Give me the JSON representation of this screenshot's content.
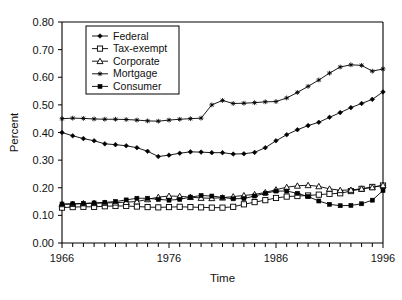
{
  "chart_data": {
    "type": "line",
    "title": "",
    "xlabel": "Time",
    "ylabel": "Percent",
    "xlim": [
      1966,
      1996
    ],
    "ylim": [
      0.0,
      0.8
    ],
    "ytick_labels": [
      "0.00",
      "0.10",
      "0.20",
      "0.30",
      "0.40",
      "0.50",
      "0.60",
      "0.70",
      "0.80"
    ],
    "ytick_values": [
      0.0,
      0.1,
      0.2,
      0.3,
      0.4,
      0.5,
      0.6,
      0.7,
      0.8
    ],
    "xtick_labels": [
      "1966",
      "1976",
      "1986",
      "1996"
    ],
    "xtick_values": [
      1966,
      1976,
      1986,
      1996
    ],
    "x_minor_tick_step": 1,
    "grid": false,
    "legend_position": "top-left-inside",
    "x": [
      1966,
      1967,
      1968,
      1969,
      1970,
      1971,
      1972,
      1973,
      1974,
      1975,
      1976,
      1977,
      1978,
      1979,
      1980,
      1981,
      1982,
      1983,
      1984,
      1985,
      1986,
      1987,
      1988,
      1989,
      1990,
      1991,
      1992,
      1993,
      1994,
      1995,
      1996
    ],
    "series": [
      {
        "name": "Federal",
        "marker": "filled-diamond",
        "values": [
          0.4,
          0.388,
          0.378,
          0.37,
          0.359,
          0.356,
          0.352,
          0.345,
          0.332,
          0.313,
          0.318,
          0.325,
          0.33,
          0.329,
          0.327,
          0.327,
          0.322,
          0.323,
          0.328,
          0.345,
          0.37,
          0.392,
          0.41,
          0.425,
          0.437,
          0.455,
          0.472,
          0.49,
          0.505,
          0.52,
          0.547
        ]
      },
      {
        "name": "Tax-exempt",
        "marker": "open-square",
        "values": [
          0.128,
          0.13,
          0.131,
          0.131,
          0.133,
          0.134,
          0.134,
          0.132,
          0.13,
          0.129,
          0.13,
          0.131,
          0.13,
          0.129,
          0.128,
          0.128,
          0.131,
          0.14,
          0.148,
          0.155,
          0.163,
          0.168,
          0.17,
          0.172,
          0.175,
          0.178,
          0.18,
          0.188,
          0.196,
          0.203,
          0.208
        ]
      },
      {
        "name": "Corporate",
        "marker": "open-triangle",
        "values": [
          0.14,
          0.141,
          0.143,
          0.144,
          0.145,
          0.146,
          0.148,
          0.15,
          0.158,
          0.166,
          0.17,
          0.169,
          0.166,
          0.163,
          0.162,
          0.164,
          0.168,
          0.172,
          0.176,
          0.183,
          0.193,
          0.202,
          0.207,
          0.209,
          0.205,
          0.196,
          0.191,
          0.192,
          0.196,
          0.201,
          0.209
        ]
      },
      {
        "name": "Mortgage",
        "marker": "asterisk",
        "values": [
          0.45,
          0.452,
          0.451,
          0.449,
          0.448,
          0.448,
          0.447,
          0.445,
          0.442,
          0.441,
          0.445,
          0.448,
          0.45,
          0.452,
          0.5,
          0.516,
          0.505,
          0.506,
          0.508,
          0.511,
          0.512,
          0.525,
          0.545,
          0.567,
          0.59,
          0.615,
          0.637,
          0.645,
          0.643,
          0.622,
          0.63
        ]
      },
      {
        "name": "Consumer",
        "marker": "filled-square",
        "values": [
          0.141,
          0.142,
          0.143,
          0.145,
          0.147,
          0.15,
          0.156,
          0.162,
          0.162,
          0.158,
          0.155,
          0.158,
          0.166,
          0.172,
          0.17,
          0.165,
          0.16,
          0.161,
          0.17,
          0.18,
          0.188,
          0.188,
          0.18,
          0.168,
          0.152,
          0.14,
          0.135,
          0.136,
          0.142,
          0.155,
          0.19
        ]
      }
    ]
  },
  "legend": {
    "items": [
      {
        "label": "Federal"
      },
      {
        "label": "Tax-exempt"
      },
      {
        "label": "Corporate"
      },
      {
        "label": "Mortgage"
      },
      {
        "label": "Consumer"
      }
    ]
  }
}
